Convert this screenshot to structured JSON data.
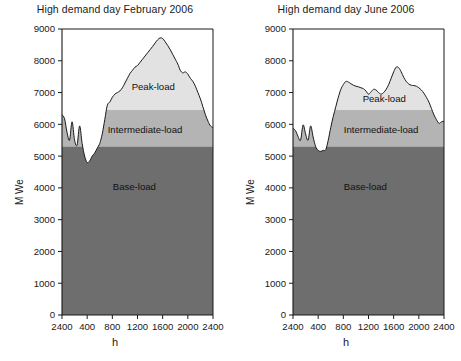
{
  "figure": {
    "background": "#ffffff",
    "panel_count": 2
  },
  "colors": {
    "base_load": "#6e6e6e",
    "intermediate_load": "#b4b4b4",
    "peak_load": "#e2e2e2",
    "curve_line": "#1a1a1a",
    "axis": "#1a1a1a",
    "text": "#1a1a1a",
    "plot_background": "#ffffff"
  },
  "chart_data": [
    {
      "type": "area",
      "title": "High demand day February 2006",
      "xlabel": "h",
      "ylabel": "M We",
      "ylim": [
        0,
        9000
      ],
      "xlim": [
        0,
        2400
      ],
      "grid": false,
      "legend": "inline-annotations",
      "ytick_labels": [
        "0",
        "1000",
        "2000",
        "3000",
        "4000",
        "5000",
        "6000",
        "7000",
        "8000",
        "9000"
      ],
      "ytick_values": [
        0,
        1000,
        2000,
        3000,
        4000,
        5000,
        6000,
        7000,
        8000,
        9000
      ],
      "xtick_labels": [
        "2400",
        "400",
        "800",
        "1200",
        "1600",
        "2000",
        "2400"
      ],
      "xtick_values": [
        0,
        400,
        800,
        1200,
        1600,
        2000,
        2400
      ],
      "bands": [
        {
          "name": "Base-load",
          "label": "Base-load",
          "from": 0,
          "to": 5300
        },
        {
          "name": "Intermediate-load",
          "label": "Intermediate-load",
          "from": 5300,
          "to": 6450
        },
        {
          "name": "Peak-load",
          "label": "Peak-load",
          "from": 6450,
          "to": "demand_curve"
        }
      ],
      "band_boundaries_mwe": {
        "base_top": 5300,
        "intermediate_top": 6450
      },
      "annotations": [
        {
          "text": "Peak-load",
          "x": 1450,
          "y": 7200
        },
        {
          "text": "Intermediate-load",
          "x": 1320,
          "y": 5850
        },
        {
          "text": "Base-load",
          "x": 1150,
          "y": 4050
        }
      ],
      "series": [
        {
          "name": "Demand",
          "x": [
            0,
            40,
            80,
            120,
            160,
            200,
            240,
            280,
            320,
            360,
            400,
            440,
            480,
            520,
            560,
            600,
            640,
            680,
            720,
            760,
            800,
            840,
            880,
            920,
            960,
            1000,
            1040,
            1080,
            1120,
            1160,
            1200,
            1240,
            1280,
            1320,
            1360,
            1400,
            1440,
            1480,
            1520,
            1560,
            1600,
            1640,
            1680,
            1720,
            1760,
            1800,
            1840,
            1880,
            1920,
            1960,
            2000,
            2040,
            2080,
            2120,
            2160,
            2200,
            2240,
            2280,
            2320,
            2360,
            2400
          ],
          "values": [
            6300,
            6180,
            5750,
            5500,
            6080,
            5500,
            5350,
            5950,
            5400,
            5000,
            4800,
            4850,
            5000,
            5100,
            5250,
            5400,
            5700,
            6150,
            6600,
            6700,
            6850,
            6950,
            7000,
            7050,
            7150,
            7300,
            7450,
            7600,
            7700,
            7800,
            7850,
            7950,
            8050,
            8150,
            8250,
            8350,
            8450,
            8560,
            8660,
            8720,
            8700,
            8600,
            8480,
            8350,
            8200,
            8050,
            7900,
            7700,
            7620,
            7650,
            7580,
            7450,
            7350,
            7200,
            7000,
            6800,
            6550,
            6300,
            6100,
            5950,
            5900
          ]
        }
      ]
    },
    {
      "type": "area",
      "title": "High demand day June 2006",
      "xlabel": "h",
      "ylabel": "M We",
      "ylim": [
        0,
        9000
      ],
      "xlim": [
        0,
        2400
      ],
      "grid": false,
      "legend": "inline-annotations",
      "ytick_labels": [
        "0",
        "1000",
        "2000",
        "3000",
        "4000",
        "5000",
        "6000",
        "7000",
        "8000",
        "9000"
      ],
      "ytick_values": [
        0,
        1000,
        2000,
        3000,
        4000,
        5000,
        6000,
        7000,
        8000,
        9000
      ],
      "xtick_labels": [
        "2400",
        "400",
        "800",
        "1200",
        "1600",
        "2000",
        "2400"
      ],
      "xtick_values": [
        0,
        400,
        800,
        1200,
        1600,
        2000,
        2400
      ],
      "bands": [
        {
          "name": "Base-load",
          "label": "Base-load",
          "from": 0,
          "to": 5300
        },
        {
          "name": "Intermediate-load",
          "label": "Intermediate-load",
          "from": 5300,
          "to": 6450
        },
        {
          "name": "Peak-load",
          "label": "Peak-load",
          "from": 6450,
          "to": "demand_curve"
        }
      ],
      "band_boundaries_mwe": {
        "base_top": 5300,
        "intermediate_top": 6450
      },
      "annotations": [
        {
          "text": "Peak-load",
          "x": 1450,
          "y": 6800
        },
        {
          "text": "Intermediate-load",
          "x": 1400,
          "y": 5820
        },
        {
          "text": "Base-load",
          "x": 1150,
          "y": 4050
        }
      ],
      "series": [
        {
          "name": "Demand",
          "x": [
            0,
            40,
            80,
            120,
            160,
            200,
            240,
            280,
            320,
            360,
            400,
            440,
            480,
            520,
            560,
            600,
            640,
            680,
            720,
            760,
            800,
            840,
            880,
            920,
            960,
            1000,
            1040,
            1080,
            1120,
            1160,
            1200,
            1240,
            1280,
            1320,
            1360,
            1400,
            1440,
            1480,
            1520,
            1560,
            1600,
            1640,
            1680,
            1720,
            1760,
            1800,
            1840,
            1880,
            1920,
            1960,
            2000,
            2040,
            2080,
            2120,
            2160,
            2200,
            2240,
            2280,
            2320,
            2360,
            2400
          ],
          "values": [
            5880,
            5800,
            5620,
            5500,
            5980,
            5700,
            5500,
            5950,
            5600,
            5300,
            5180,
            5150,
            5180,
            5200,
            5500,
            5900,
            6250,
            6550,
            6850,
            7100,
            7250,
            7350,
            7330,
            7280,
            7230,
            7200,
            7180,
            7150,
            7120,
            7050,
            6950,
            7020,
            7100,
            7080,
            7000,
            6950,
            7000,
            7100,
            7250,
            7450,
            7650,
            7800,
            7780,
            7650,
            7480,
            7350,
            7270,
            7230,
            7220,
            7200,
            7150,
            7080,
            6980,
            6850,
            6700,
            6500,
            6300,
            6150,
            6030,
            6080,
            6100
          ]
        }
      ]
    }
  ]
}
